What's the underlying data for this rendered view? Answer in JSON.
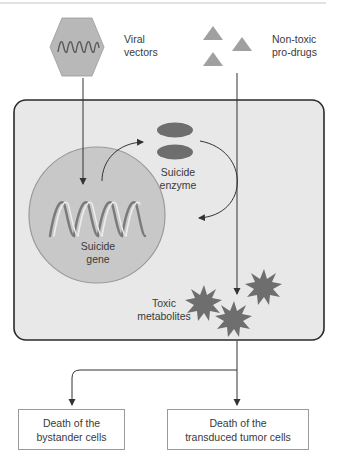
{
  "diagram": {
    "type": "suicide gene therapy mechanism",
    "colors": {
      "cell_fill": "#e8e8e8",
      "cell_stroke": "#2a2a2a",
      "nucleus_fill": "#c8c8c8",
      "nucleus_stroke": "#9a9a9a",
      "vector_fill": "#b8b8b8",
      "enzyme_fill": "#6e6e6e",
      "prodrug_fill": "#a0a0a0",
      "metabolite_fill": "#6e6e6e",
      "line": "#333333"
    },
    "labels": {
      "viral_vectors": [
        "Viral",
        "vectors"
      ],
      "prodrugs": [
        "Non-toxic",
        "pro-drugs"
      ],
      "enzyme": [
        "Suicide",
        "enzyme"
      ],
      "gene": [
        "Suicide",
        "gene"
      ],
      "metabolites": [
        "Toxic",
        "metabolites"
      ]
    },
    "outcomes": [
      {
        "lines": [
          "Death of the",
          "bystander cells"
        ]
      },
      {
        "lines": [
          "Death of the",
          "transduced tumor cells"
        ]
      }
    ]
  }
}
